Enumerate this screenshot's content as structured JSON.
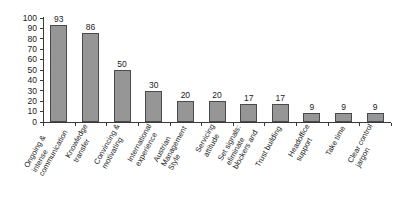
{
  "chart_data": {
    "type": "bar",
    "title": "",
    "subtitle": "",
    "xlabel": "",
    "ylabel": "",
    "ylim": [
      0,
      100
    ],
    "ytick_step": 10,
    "yticks": [
      100,
      90,
      80,
      70,
      60,
      50,
      40,
      30,
      20,
      10,
      0
    ],
    "grid": false,
    "legend": false,
    "legend_position": "none",
    "data_labels": true,
    "orientation": "vertical",
    "bar_color": "#969696",
    "bar_edge_color": "#4a4a4a",
    "axis_color": "#3a3a3a",
    "label_rotation_deg": -61,
    "categories": [
      "Ongoing & intense communication",
      "Knowledge transfer",
      "Convincing & motivating",
      "International experience",
      "Austrian Management Style",
      "Servicing attitude",
      "Set signals: eliminate blockers and",
      "Trust building",
      "Headoffice support",
      "Take time",
      "Clear control jargon"
    ],
    "category_lines": [
      [
        "Ongoing &",
        "intense",
        "communication"
      ],
      [
        "Knowledge",
        "transfer"
      ],
      [
        "Convincing &",
        "motivating"
      ],
      [
        "International",
        "experience"
      ],
      [
        "Austrian",
        "Management",
        "Style"
      ],
      [
        "Servicing",
        "attitude"
      ],
      [
        "Set signals:",
        "eliminate",
        "blockers and"
      ],
      [
        "Trust building"
      ],
      [
        "Headoffice",
        "support"
      ],
      [
        "Take time"
      ],
      [
        "Clear control",
        "jargon"
      ]
    ],
    "values": [
      93,
      86,
      50,
      30,
      20,
      20,
      17,
      17,
      9,
      9,
      9
    ]
  }
}
